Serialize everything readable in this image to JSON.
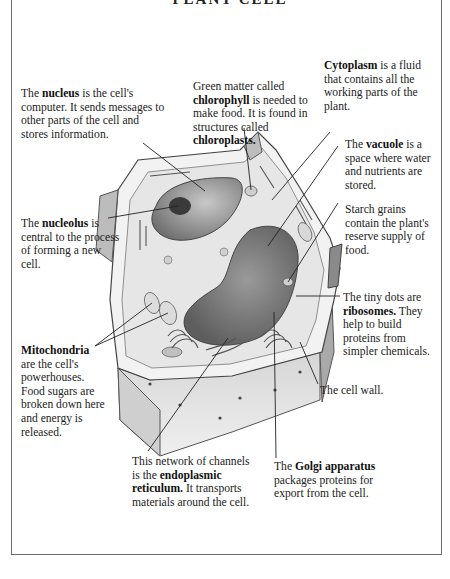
{
  "title": "PLANT CELL",
  "labels": {
    "chlorophyll": {
      "pre": "Green matter called ",
      "term": "chlorophyll",
      "mid": " is needed to make food. It is found in structures called ",
      "term2": "chloroplasts."
    },
    "cytoplasm": {
      "term": "Cytoplasm",
      "post": " is a fluid that contains all the working parts of the plant."
    },
    "nucleus": {
      "pre": "The ",
      "term": "nucleus",
      "post": " is the cell's computer. It sends messages to other parts of the cell and stores information."
    },
    "vacuole": {
      "pre": "The ",
      "term": "vacuole",
      "post": " is a space where water and nutrients are stored."
    },
    "starch": {
      "text": "Starch grains contain the plant's reserve supply of food."
    },
    "nucleolus": {
      "pre": "The ",
      "term": "nucleolus",
      "post": " is central to the process of forming a new cell."
    },
    "ribosomes": {
      "pre": "The tiny dots are ",
      "term": "ribosomes.",
      "post": " They help to build proteins from simpler chemicals."
    },
    "cell_wall": {
      "text": "The cell wall."
    },
    "mitochondria": {
      "term": "Mitochondria",
      "post": " are the cell's powerhouses. Food sugars are broken down here and energy is released."
    },
    "er": {
      "pre": "This network of channels is the ",
      "term": "endoplasmic reticulum.",
      "post": " It transports materials around the cell."
    },
    "golgi": {
      "pre": "The ",
      "term": "Golgi apparatus",
      "post": " packages proteins for export from the cell."
    }
  },
  "colors": {
    "ink": "#1e1e1e",
    "frame": "#6d6d6d",
    "cell_light": "#e9e9e9",
    "cell_mid": "#bdbdbd",
    "cell_dark": "#6a6a6a"
  }
}
